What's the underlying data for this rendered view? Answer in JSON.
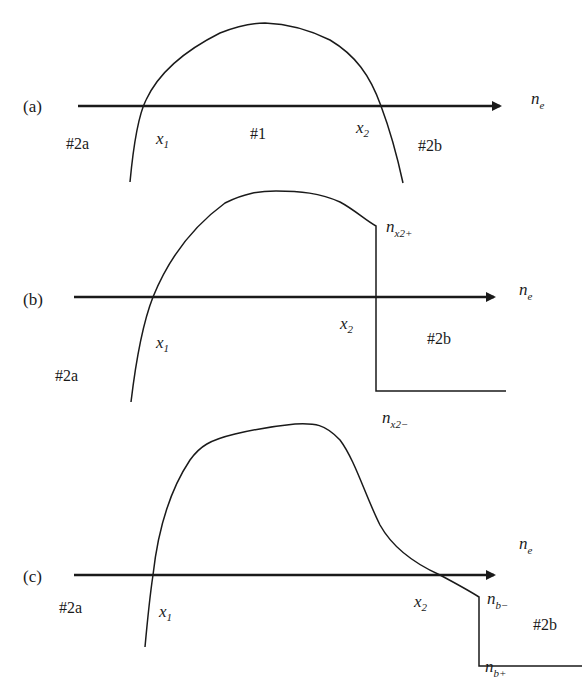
{
  "figure": {
    "axis_label_main": "n",
    "axis_label_sub": "e",
    "panels": [
      {
        "id": "a",
        "label": "(a)",
        "regions": {
          "left": "#2a",
          "middle": "#1",
          "right": "#2b"
        },
        "points": {
          "x1_main": "x",
          "x1_sub": "1",
          "x2_main": "x",
          "x2_sub": "2"
        }
      },
      {
        "id": "b",
        "label": "(b)",
        "regions": {
          "left": "#2a",
          "right": "#2b"
        },
        "points": {
          "x1_main": "x",
          "x1_sub": "1",
          "x2_main": "x",
          "x2_sub": "2"
        },
        "jump_labels": {
          "upper_main": "n",
          "upper_sub": "x2+",
          "lower_main": "n",
          "lower_sub": "x2−"
        }
      },
      {
        "id": "c",
        "label": "(c)",
        "regions": {
          "left": "#2a",
          "right": "#2b"
        },
        "points": {
          "x1_main": "x",
          "x1_sub": "1",
          "x2_main": "x",
          "x2_sub": "2"
        },
        "jump_labels": {
          "upper_main": "n",
          "upper_sub": "b−",
          "lower_main": "n",
          "lower_sub": "b+"
        }
      }
    ]
  },
  "colors": {
    "ink": "#1a1a1a",
    "background": "#ffffff"
  }
}
